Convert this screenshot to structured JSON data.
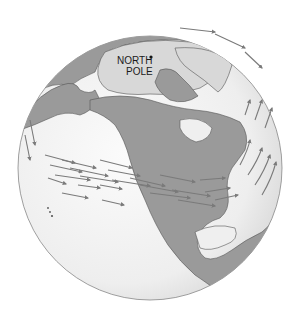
{
  "figure": {
    "label_pole_line1": "NORTH",
    "label_pole_line2": "POLE"
  },
  "colors": {
    "ocean": "#efefef",
    "land": "#9a9a9a",
    "ice": "#d8d8d8",
    "outline": "#555555",
    "arrows": "#7a7a7a"
  }
}
